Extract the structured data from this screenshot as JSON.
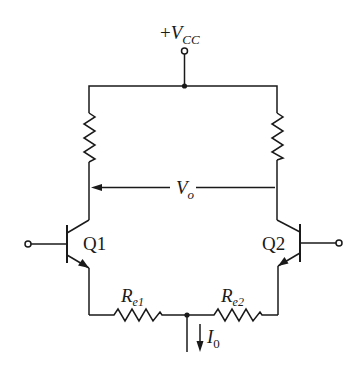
{
  "diagram": {
    "type": "circuit-schematic",
    "supply": {
      "label_prefix": "+",
      "label_main": "V",
      "label_sub": "CC"
    },
    "output": {
      "label_main": "V",
      "label_sub": "o"
    },
    "transistors": [
      {
        "id": "Q1",
        "label": "Q1",
        "type": "NPN",
        "side": "left"
      },
      {
        "id": "Q2",
        "label": "Q2",
        "type": "NPN",
        "side": "right"
      }
    ],
    "resistors": [
      {
        "id": "Rc1",
        "label": "",
        "position": "left collector load"
      },
      {
        "id": "Rc2",
        "label": "",
        "position": "right collector load"
      },
      {
        "id": "Re1",
        "label_main": "R",
        "label_sub": "e1",
        "position": "left emitter"
      },
      {
        "id": "Re2",
        "label_main": "R",
        "label_sub": "e2",
        "position": "right emitter"
      }
    ],
    "current_source": {
      "label_main": "I",
      "label_sub": "0",
      "direction": "down"
    },
    "colors": {
      "line": "#1a1a1a",
      "background": "#ffffff"
    }
  }
}
